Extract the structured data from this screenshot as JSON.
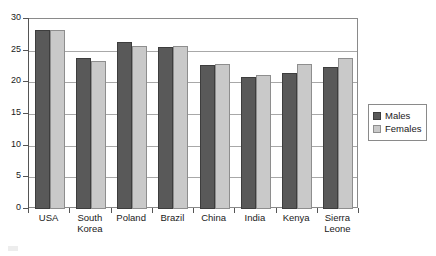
{
  "chart_data": {
    "type": "bar",
    "title": "",
    "subtitle": "",
    "xlabel": "",
    "ylabel": "",
    "ylim": [
      0,
      30
    ],
    "yticks": [
      0,
      5,
      10,
      15,
      20,
      25,
      30
    ],
    "grid": true,
    "legend_position": "right",
    "categories": [
      "USA",
      "South\nKorea",
      "Poland",
      "Brazil",
      "China",
      "India",
      "Kenya",
      "Sierra\nLeone"
    ],
    "series": [
      {
        "name": "Males",
        "color": "#595959",
        "values": [
          28.3,
          23.9,
          26.4,
          25.6,
          22.8,
          20.8,
          21.5,
          22.4
        ]
      },
      {
        "name": "Females",
        "color": "#c9c9c9",
        "values": [
          28.2,
          23.3,
          25.8,
          25.8,
          22.9,
          21.2,
          22.9,
          23.8
        ]
      }
    ]
  },
  "legend": {
    "items": [
      {
        "label": "Males",
        "swatch": "males"
      },
      {
        "label": "Females",
        "swatch": "females"
      }
    ]
  },
  "colors": {
    "males": "#595959",
    "females": "#c9c9c9",
    "axis": "#555555",
    "grid": "#a8a8a8",
    "frame": "#8a8a8a",
    "background": "#ffffff"
  }
}
